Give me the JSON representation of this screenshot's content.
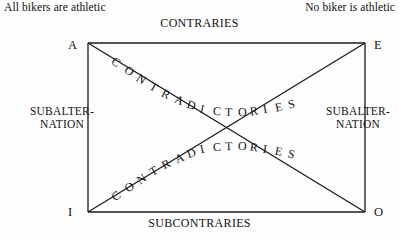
{
  "diagram": {
    "title_type": "square-of-opposition",
    "captions": {
      "left": "All bikers are athletic",
      "right": "No biker is athletic"
    },
    "edges": {
      "top": "CONTRARIES",
      "bottom": "SUBCONTRARIES",
      "left": "SUBALTER-\nNATION",
      "left_line1": "SUBALTER-",
      "left_line2": "NATION",
      "right_line1": "SUBALTER-",
      "right_line2": "NATION"
    },
    "corners": {
      "top_left": "A",
      "top_right": "E",
      "bottom_left": "I",
      "bottom_right": "O"
    },
    "diagonals": {
      "descending": "CONTRADICTORIES",
      "ascending": "CONTRADICTORIES"
    },
    "colors": {
      "background": "#fdfdfd",
      "ink": "#111111",
      "line": "#1a1a1a"
    },
    "geometry": {
      "rect_left": 88,
      "rect_top": 43,
      "rect_right": 365,
      "rect_bottom": 212
    }
  }
}
